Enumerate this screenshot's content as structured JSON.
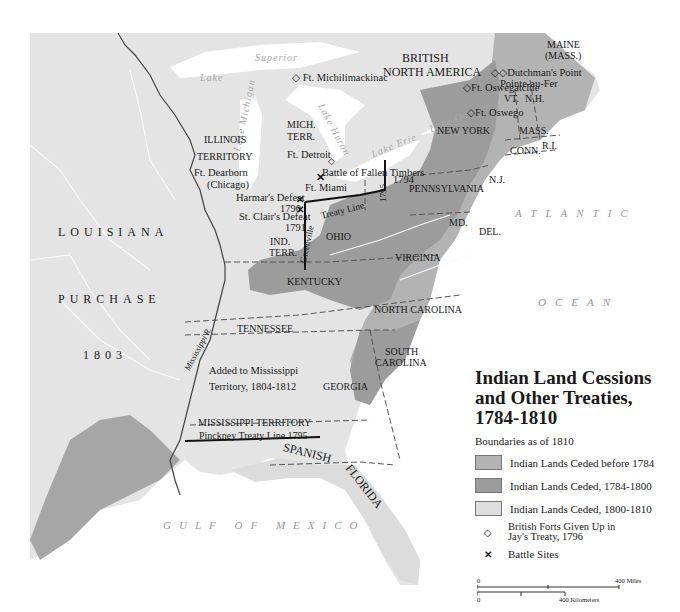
{
  "legend": {
    "title_line1": "Indian Land Cessions",
    "title_line2": "and Other Treaties,",
    "title_line3": "1784-1810",
    "subtitle": "Boundaries as of 1810",
    "items": [
      {
        "label": "Indian Lands Ceded before 1784",
        "color": "#b3b3b3"
      },
      {
        "label": "Indian Lands Ceded, 1784-1800",
        "color": "#9c9c9c"
      },
      {
        "label": "Indian Lands Ceded, 1800-1810",
        "color": "#dedede"
      },
      {
        "label_line1": "British Forts Given Up in",
        "label_line2": "Jay's Treaty, 1796",
        "symbol": "◇"
      },
      {
        "label": "Battle Sites",
        "symbol": "✕"
      }
    ],
    "scale": {
      "miles_zero": "0",
      "miles_max": "400 Miles",
      "km_zero": "0",
      "km_max": "400 Kilometers"
    }
  },
  "regions": {
    "british_north_america_1": "BRITISH",
    "british_north_america_2": "NORTH AMERICA",
    "louisiana": "LOUISIANA",
    "purchase": "PURCHASE",
    "year_1803": "1803",
    "spanish": "SPANISH",
    "florida": "FLORIDA"
  },
  "states": {
    "maine_1": "MAINE",
    "maine_2": "(MASS.)",
    "vt": "VT.",
    "nh": "N.H.",
    "mass": "MASS.",
    "conn": "CONN.",
    "ri": "R.I.",
    "new_york": "NEW YORK",
    "nj": "N.J.",
    "pennsylvania": "PENNSYLVANIA",
    "md": "MD.",
    "del": "DEL.",
    "virginia": "VIRGINIA",
    "north_carolina": "NORTH CAROLINA",
    "south_carolina_1": "SOUTH",
    "south_carolina_2": "CAROLINA",
    "georgia": "GEORGIA",
    "kentucky": "KENTUCKY",
    "tennessee": "TENNESSEE",
    "ohio": "OHIO",
    "ind_terr_1": "IND.",
    "ind_terr_2": "TERR.",
    "illinois_1": "ILLINOIS",
    "illinois_2": "TERRITORY",
    "mich_1": "MICH.",
    "mich_2": "TERR.",
    "miss_added_1": "Added to Mississippi",
    "miss_added_2": "Territory, 1804-1812",
    "miss_terr": "MISSISSIPPI TERRITORY"
  },
  "places": {
    "ft_michilimackinac": "Ft. Michilimackinac",
    "ft_detroit": "Ft. Detroit",
    "ft_miami": "Ft. Miami",
    "ft_dearborn_1": "Ft. Dearborn",
    "ft_dearborn_2": "(Chicago)",
    "ft_oswegatchie": "Ft. Oswegatchie",
    "ft_oswego": "Ft. Oswego",
    "dutchmans_point": "Dutchman's Point",
    "pointe_au_fer": "Pointe-au-Fer",
    "fallen_timbers_1": "Battle of Fallen Timbers",
    "fallen_timbers_2": "1794",
    "harmar_1": "Harmar's Defeat",
    "harmar_2": "1790",
    "st_clair_1": "St. Clair's Defeat",
    "st_clair_2": "1791"
  },
  "lines": {
    "treaty_line": "Treaty Line",
    "greenville": "Greenville",
    "year_1795": "1795",
    "pinckney": "Pinckney Treaty Line 1795",
    "mississippi_r": "Mississippi R."
  },
  "water": {
    "lake": "Lake",
    "superior": "Superior",
    "lake_michigan": "Lake Michigan",
    "lake_huron": "Lake Huron",
    "lake_erie": "Lake Erie",
    "lake_ontario": "Lake Ontario",
    "atlantic": "ATLANTIC",
    "ocean": "OCEAN",
    "gulf": "GULF OF MEXICO"
  },
  "colors": {
    "unceded": "#e6e6e6",
    "before_1784": "#b3b3b3",
    "ceded_1784_1800": "#9c9c9c",
    "ceded_1800_1810": "#dedede",
    "water": "#ffffff",
    "border": "#555555"
  }
}
